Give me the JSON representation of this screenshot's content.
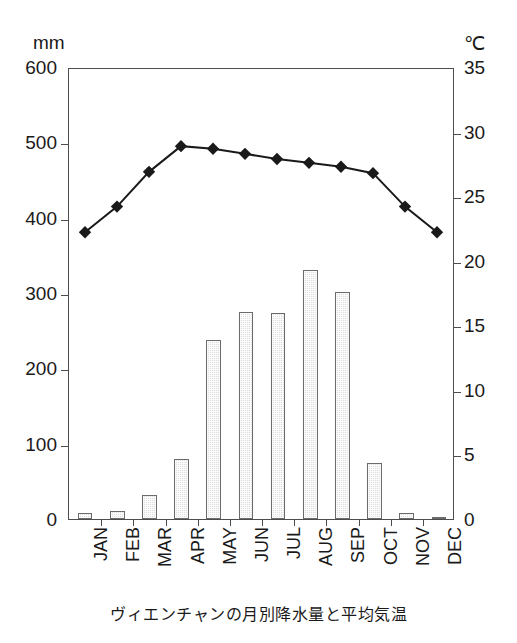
{
  "caption": "ヴィエンチャンの月別降水量と平均気温",
  "axes": {
    "left_unit": "mm",
    "right_unit": "℃",
    "left_ticks": [
      "600",
      "500",
      "400",
      "300",
      "200",
      "100",
      "0"
    ],
    "right_ticks": [
      "35",
      "30",
      "25",
      "20",
      "15",
      "10",
      "5",
      "0"
    ]
  },
  "colors": {
    "bar_fill": "#dededc",
    "bar_stroke": "#6b6b6b",
    "line": "#1a1a1a",
    "marker": "#1a1a1a",
    "frame": "#4d4d4d",
    "text": "#1a1a1a",
    "background": "#ffffff"
  },
  "chart_data": {
    "type": "bar",
    "title": "ヴィエンチャンの月別降水量と平均気温",
    "xlabel": "",
    "ylabel": "mm",
    "y2label": "℃",
    "ylim": [
      0,
      600
    ],
    "y2lim": [
      0,
      35
    ],
    "grid": false,
    "legend": "none",
    "categories": [
      "JAN",
      "FEB",
      "MAR",
      "APR",
      "MAY",
      "JUN",
      "JUL",
      "AUG",
      "SEP",
      "OCT",
      "NOV",
      "DEC"
    ],
    "series": [
      {
        "name": "降水量",
        "type": "bar",
        "unit": "mm",
        "axis": "left",
        "values": [
          8,
          10,
          32,
          80,
          237,
          275,
          274,
          330,
          302,
          75,
          8,
          3
        ]
      },
      {
        "name": "平均気温",
        "type": "line",
        "unit": "℃",
        "axis": "right",
        "marker": "diamond",
        "values": [
          22.3,
          24.3,
          27.0,
          29.0,
          28.8,
          28.4,
          28.0,
          27.7,
          27.4,
          26.9,
          24.3,
          22.3
        ]
      }
    ]
  }
}
